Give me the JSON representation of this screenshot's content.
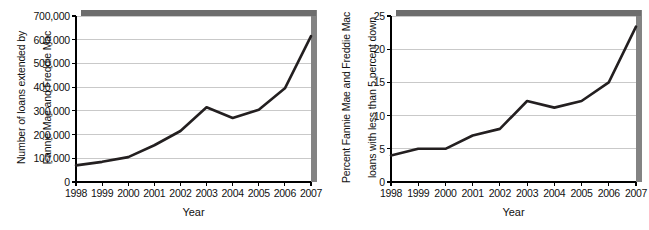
{
  "figure": {
    "background": "#ffffff",
    "line_color": "#231f20",
    "grid_color": "#c9c9c9",
    "axis_color": "#000000",
    "shadow_color": "#6d6d6d"
  },
  "chart_data": [
    {
      "id": "loans-extended",
      "type": "line",
      "title": "",
      "xlabel": "Year",
      "ylabel": "Number of loans extended by Fannie Mae and Freddie Mac",
      "ylabel_lines": [
        "Number of loans extended by",
        "Fannie Mae and Freddie Mac"
      ],
      "categories": [
        1998,
        1999,
        2000,
        2001,
        2002,
        2003,
        2004,
        2005,
        2006,
        2007
      ],
      "xtick_labels": [
        "1998",
        "1999",
        "2000",
        "2001",
        "2002",
        "2003",
        "2004",
        "2005",
        "2006",
        "2007"
      ],
      "values": [
        70000,
        85000,
        105000,
        155000,
        215000,
        315000,
        270000,
        305000,
        395000,
        615000
      ],
      "ytick_values": [
        0,
        100000,
        200000,
        300000,
        400000,
        500000,
        600000,
        700000
      ],
      "ytick_labels": [
        "0",
        "100,000",
        "200,000",
        "300,000",
        "400,000",
        "500,000",
        "600,000",
        "700,000"
      ],
      "ylim": [
        0,
        700000
      ],
      "xlim": [
        1998,
        2007
      ],
      "grid": true,
      "legend": "none"
    },
    {
      "id": "percent-low-downpayment",
      "type": "line",
      "title": "",
      "xlabel": "Year",
      "ylabel": "Percent Fannie Mae and Freddie Mac loans with less than 5 percent down",
      "ylabel_lines": [
        "Percent Fannie Mae and Freddie Mac",
        "loans with less than 5 percent down"
      ],
      "categories": [
        1998,
        1999,
        2000,
        2001,
        2002,
        2003,
        2004,
        2005,
        2006,
        2007
      ],
      "xtick_labels": [
        "1998",
        "1999",
        "2000",
        "2001",
        "2002",
        "2003",
        "2004",
        "2005",
        "2006",
        "2007"
      ],
      "values": [
        4.0,
        5.0,
        5.0,
        7.0,
        8.0,
        12.2,
        11.2,
        12.2,
        15.0,
        23.4
      ],
      "ytick_values": [
        0,
        5,
        10,
        15,
        20,
        25
      ],
      "ytick_labels": [
        "0",
        "5",
        "10",
        "15",
        "20",
        "25"
      ],
      "ylim": [
        0,
        25
      ],
      "xlim": [
        1998,
        2007
      ],
      "grid": true,
      "legend": "none"
    }
  ]
}
